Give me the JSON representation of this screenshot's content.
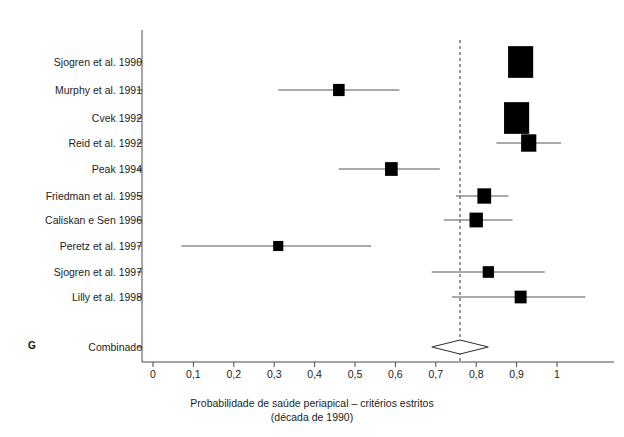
{
  "figure": {
    "panel_letter": "G",
    "axis_title_line1": "Probabilidade de saúde periapical – critérios estritos",
    "axis_title_line2": "(década de 1990)"
  },
  "chart_data": {
    "type": "forest",
    "title": "",
    "xlabel": "Probabilidade de saúde periapical – critérios estritos (década de 1990)",
    "ylabel": "",
    "xlim": [
      0,
      1.08
    ],
    "xticks": [
      0,
      0.1,
      0.2,
      0.3,
      0.4,
      0.5,
      0.6,
      0.7,
      0.8,
      0.9,
      1
    ],
    "xtick_labels": [
      "0",
      "0,1",
      "0,2",
      "0,3",
      "0,4",
      "0,5",
      "0,6",
      "0,7",
      "0,8",
      "0,9",
      "1"
    ],
    "grid": false,
    "legend": null,
    "reference_line": {
      "value": 0.76,
      "style": "dashed",
      "color": "#444444"
    },
    "marker_color": "#000000",
    "line_color": "#555555",
    "studies": [
      {
        "label": "Sjogren et al. 1990",
        "estimate": 0.91,
        "ci_low": 0.88,
        "ci_high": 0.94,
        "weight": 0.95
      },
      {
        "label": "Murphy et al. 1991",
        "estimate": 0.46,
        "ci_low": 0.31,
        "ci_high": 0.61,
        "weight": 0.2
      },
      {
        "label": "Cvek 1992",
        "estimate": 0.9,
        "ci_low": 0.87,
        "ci_high": 0.93,
        "weight": 0.95
      },
      {
        "label": "Reid et al. 1992",
        "estimate": 0.93,
        "ci_low": 0.85,
        "ci_high": 1.01,
        "weight": 0.4
      },
      {
        "label": "Peak 1994",
        "estimate": 0.59,
        "ci_low": 0.46,
        "ci_high": 0.71,
        "weight": 0.26
      },
      {
        "label": "Friedman et al. 1995",
        "estimate": 0.82,
        "ci_low": 0.75,
        "ci_high": 0.88,
        "weight": 0.32
      },
      {
        "label": "Caliskan e Sen 1996",
        "estimate": 0.8,
        "ci_low": 0.72,
        "ci_high": 0.89,
        "weight": 0.3
      },
      {
        "label": "Peretz et al. 1997",
        "estimate": 0.31,
        "ci_low": 0.07,
        "ci_high": 0.54,
        "weight": 0.12
      },
      {
        "label": "Sjogren et al. 1997",
        "estimate": 0.83,
        "ci_low": 0.69,
        "ci_high": 0.97,
        "weight": 0.18
      },
      {
        "label": "Lilly et al. 1998",
        "estimate": 0.91,
        "ci_low": 0.74,
        "ci_high": 1.07,
        "weight": 0.22
      }
    ],
    "summary": {
      "label": "Combinado",
      "estimate": 0.76,
      "ci_low": 0.69,
      "ci_high": 0.83,
      "shape": "diamond"
    }
  }
}
